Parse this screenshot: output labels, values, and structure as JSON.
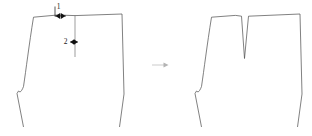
{
  "diagram": {
    "type": "sewing-pattern-dart-construction",
    "stroke_color": "#4a4a4a",
    "marker_color": "#111111",
    "arrow_color": "#b4b4b4",
    "background": "#ffffff",
    "labels": {
      "dart_width_label": "1",
      "dart_depth_label": "2"
    },
    "panels": [
      {
        "name": "before",
        "caption": "",
        "has_dart_cut": false,
        "has_dimension_markers": true
      },
      {
        "name": "after",
        "caption": "",
        "has_dart_cut": true,
        "has_dimension_markers": false
      }
    ],
    "transition": {
      "glyph": "arrow-right"
    }
  },
  "geometry": {
    "left_panel": {
      "outline": "M 33.5 17.2 L 23.5 86.5 L 20.0 92.0 L 18.5 91.0 L 17.0 93.5 L 23.5 127.0",
      "outline_top": "M 33.5 17.2 L 57.5 15.0 L 75.0 15.6 L 122.0 14.0",
      "outline_right": "M 122.0 14.0 L 124.0 94.0 L 119.5 127.0",
      "waist_curve": "M 33.5 17.2 C 29.0 45.0 26.0 70.0 23.5 86.5 C 22.3 89.8 21.0 91.6 20.0 92.0 L 18.5 91.0 L 17.0 93.5 L 23.5 127.0",
      "dart_vertical": "M 75.0 15.6 L 75.0 57.0"
    },
    "right_panel": {
      "waist_curve": "M 211.5 17.2 C 207.0 45.0 204.0 70.0 201.5 86.5 C 200.3 89.8 199.0 91.6 198.0 92.0 L 196.5 91.0 L 195.0 93.5 L 201.5 127.0",
      "outline_top_left": "M 211.5 17.2 L 235.5 15.4 L 241.5 16.2",
      "dart_v": "M 241.5 16.2 L 244.5 58.5 L 248.5 16.2",
      "outline_top_right": "M 248.5 16.2 L 300.0 14.0",
      "outline_right": "M 300.0 14.0 L 302.0 94.0 L 297.5 127.0"
    },
    "markers": {
      "dim1": {
        "x1": 55.0,
        "x2": 66.0,
        "y": 16.0,
        "tick_y1": 6.5,
        "tick_y2": 16.0,
        "label_x": 59.5,
        "label_y": 7.5
      },
      "dim2": {
        "x1": 70.5,
        "x2": 78.0,
        "y": 42.0,
        "label_x": 65.0,
        "label_y": 42.0
      }
    },
    "flow_arrow": {
      "x1": 152.0,
      "x2": 168.0,
      "y": 65.0
    }
  }
}
